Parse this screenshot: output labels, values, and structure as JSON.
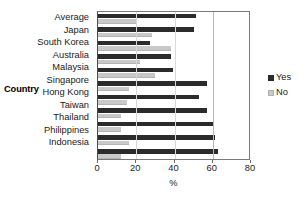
{
  "chart_data": {
    "type": "bar",
    "orientation": "horizontal",
    "title": "",
    "xlabel": "%",
    "ylabel": "Country",
    "xlim": [
      0,
      80
    ],
    "xticks": [
      0,
      20,
      40,
      60,
      80
    ],
    "grid": true,
    "legend_position": "right",
    "categories": [
      "Average",
      "Japan",
      "South Korea",
      "Australia",
      "Malaysia",
      "Singapore",
      "Hong Kong",
      "Taiwan",
      "Thailand",
      "Philippines",
      "Indonesia"
    ],
    "series": [
      {
        "name": "Yes",
        "color": "#2b2b2b",
        "values": [
          51,
          50,
          27,
          38,
          39,
          57,
          53,
          57,
          60,
          61,
          63
        ]
      },
      {
        "name": "No",
        "color": "#c9c9c9",
        "values": [
          20,
          28,
          38,
          22,
          30,
          16,
          15,
          12,
          12,
          16,
          12
        ]
      }
    ]
  }
}
